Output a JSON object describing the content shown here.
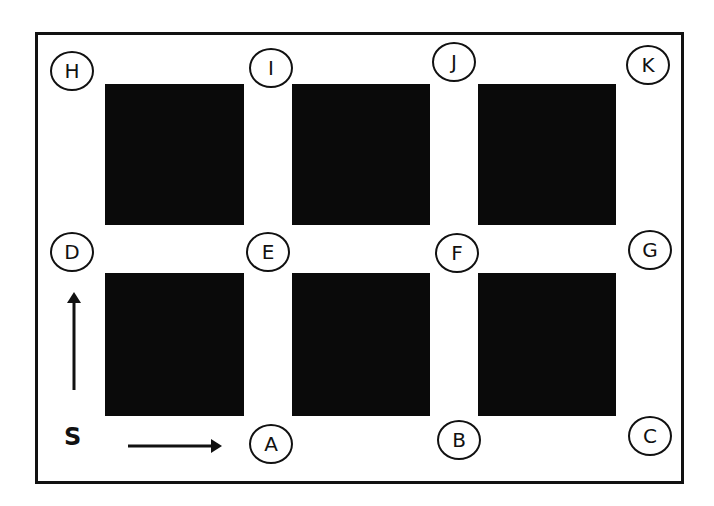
{
  "diagram": {
    "type": "grid-route-map",
    "start_label": "S",
    "colors": {
      "ink": "#111111",
      "block": "#0a0a0a",
      "background": "#ffffff"
    },
    "blocks": [
      {
        "id": "b1",
        "row": 1,
        "col": 1,
        "x": 105,
        "y": 84,
        "w": 139,
        "h": 141
      },
      {
        "id": "b2",
        "row": 1,
        "col": 2,
        "x": 292,
        "y": 84,
        "w": 138,
        "h": 141
      },
      {
        "id": "b3",
        "row": 1,
        "col": 3,
        "x": 478,
        "y": 84,
        "w": 138,
        "h": 141
      },
      {
        "id": "b4",
        "row": 2,
        "col": 1,
        "x": 105,
        "y": 273,
        "w": 139,
        "h": 143
      },
      {
        "id": "b5",
        "row": 2,
        "col": 2,
        "x": 292,
        "y": 273,
        "w": 138,
        "h": 143
      },
      {
        "id": "b6",
        "row": 2,
        "col": 3,
        "x": 478,
        "y": 273,
        "w": 138,
        "h": 143
      }
    ],
    "nodes": [
      {
        "label": "H",
        "x": 72,
        "y": 71
      },
      {
        "label": "I",
        "x": 271,
        "y": 68
      },
      {
        "label": "J",
        "x": 454,
        "y": 62
      },
      {
        "label": "K",
        "x": 648,
        "y": 65
      },
      {
        "label": "D",
        "x": 72,
        "y": 252
      },
      {
        "label": "E",
        "x": 268,
        "y": 252
      },
      {
        "label": "F",
        "x": 457,
        "y": 253
      },
      {
        "label": "G",
        "x": 650,
        "y": 250
      },
      {
        "label": "A",
        "x": 271,
        "y": 444
      },
      {
        "label": "B",
        "x": 459,
        "y": 440
      },
      {
        "label": "C",
        "x": 650,
        "y": 436
      }
    ],
    "arrows": [
      {
        "id": "arrow-up",
        "direction": "up",
        "from": [
          74,
          390
        ],
        "to": [
          74,
          293
        ]
      },
      {
        "id": "arrow-right",
        "direction": "right",
        "from": [
          128,
          446
        ],
        "to": [
          221,
          446
        ]
      }
    ]
  }
}
